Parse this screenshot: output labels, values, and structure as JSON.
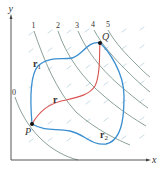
{
  "figure": {
    "axes": {
      "x_label": "x",
      "y_label": "y"
    },
    "level_curves": {
      "labels": [
        "0",
        "1",
        "2",
        "3",
        "4",
        "5"
      ],
      "color": "#6f8a7e"
    },
    "vector_field": {
      "color": "#b9d3df"
    },
    "points": {
      "start": {
        "label": "P"
      },
      "end": {
        "label": "Q"
      }
    },
    "paths": {
      "r1": {
        "label": "r",
        "subscript": "1",
        "color": "#3b8fd0"
      },
      "r2": {
        "label": "r",
        "subscript": "2",
        "color": "#3b8fd0"
      },
      "r": {
        "label": "r",
        "color": "#d9534f"
      }
    }
  }
}
